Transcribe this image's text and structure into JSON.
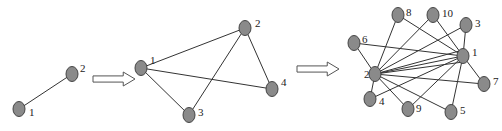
{
  "colors": {
    "background": "#ffffff",
    "node_fill": "#8a8a8a",
    "node_stroke": "#444444",
    "edge": "#333333",
    "label": "#222222",
    "arrow_stroke": "#555555"
  },
  "graphs": [
    {
      "name": "graph-stage-1",
      "nodes": [
        {
          "id": "1",
          "label": "1",
          "x": 19,
          "y": 109,
          "lx": 29,
          "ly": 116
        },
        {
          "id": "2",
          "label": "2",
          "x": 72,
          "y": 74,
          "lx": 80,
          "ly": 72
        }
      ],
      "edges": [
        [
          "1",
          "2"
        ]
      ]
    },
    {
      "name": "graph-stage-2",
      "nodes": [
        {
          "id": "1",
          "label": "1",
          "x": 141,
          "y": 68,
          "lx": 150,
          "ly": 64
        },
        {
          "id": "2",
          "label": "2",
          "x": 245,
          "y": 28,
          "lx": 255,
          "ly": 27
        },
        {
          "id": "3",
          "label": "3",
          "x": 189,
          "y": 115,
          "lx": 198,
          "ly": 116
        },
        {
          "id": "4",
          "label": "4",
          "x": 272,
          "y": 89,
          "lx": 281,
          "ly": 86
        }
      ],
      "edges": [
        [
          "1",
          "2"
        ],
        [
          "1",
          "3"
        ],
        [
          "1",
          "4"
        ],
        [
          "2",
          "3"
        ],
        [
          "2",
          "4"
        ]
      ]
    },
    {
      "name": "graph-stage-3",
      "nodes": [
        {
          "id": "1",
          "label": "1",
          "x": 463,
          "y": 56,
          "lx": 472,
          "ly": 56
        },
        {
          "id": "2",
          "label": "2",
          "x": 375,
          "y": 74,
          "lx": 364,
          "ly": 78
        },
        {
          "id": "3",
          "label": "3",
          "x": 466,
          "y": 25,
          "lx": 475,
          "ly": 27
        },
        {
          "id": "4",
          "label": "4",
          "x": 370,
          "y": 99,
          "lx": 379,
          "ly": 105
        },
        {
          "id": "5",
          "label": "5",
          "x": 451,
          "y": 112,
          "lx": 460,
          "ly": 114
        },
        {
          "id": "6",
          "label": "6",
          "x": 354,
          "y": 43,
          "lx": 362,
          "ly": 43
        },
        {
          "id": "7",
          "label": "7",
          "x": 484,
          "y": 84,
          "lx": 493,
          "ly": 85
        },
        {
          "id": "8",
          "label": "8",
          "x": 398,
          "y": 15,
          "lx": 406,
          "ly": 16
        },
        {
          "id": "9",
          "label": "9",
          "x": 408,
          "y": 109,
          "lx": 416,
          "ly": 112
        },
        {
          "id": "10",
          "label": "10",
          "x": 433,
          "y": 15,
          "lx": 442,
          "ly": 17
        }
      ],
      "edges": [
        [
          "2",
          "8"
        ],
        [
          "2",
          "10"
        ],
        [
          "2",
          "3"
        ],
        [
          "2",
          "1"
        ],
        [
          "2",
          "7"
        ],
        [
          "2",
          "4"
        ],
        [
          "2",
          "9"
        ],
        [
          "2",
          "5"
        ],
        [
          "2",
          "6"
        ],
        [
          "6",
          "1"
        ],
        [
          "8",
          "1"
        ],
        [
          "10",
          "1"
        ],
        [
          "3",
          "1"
        ],
        [
          "1",
          "7"
        ],
        [
          "1",
          "5"
        ],
        [
          "1",
          "9"
        ],
        [
          "4",
          "1"
        ]
      ],
      "extra_edges_from_2_to_1_fan": [
        {
          "x1": 375,
          "y1": 74,
          "x2": 463,
          "y2": 50
        },
        {
          "x1": 375,
          "y1": 74,
          "x2": 463,
          "y2": 62
        }
      ]
    }
  ],
  "arrows": [
    {
      "name": "arrow-stage-1-to-2",
      "x": 93,
      "y": 72,
      "w": 42,
      "h": 14
    },
    {
      "name": "arrow-stage-2-to-3",
      "x": 297,
      "y": 62,
      "w": 42,
      "h": 14
    }
  ]
}
